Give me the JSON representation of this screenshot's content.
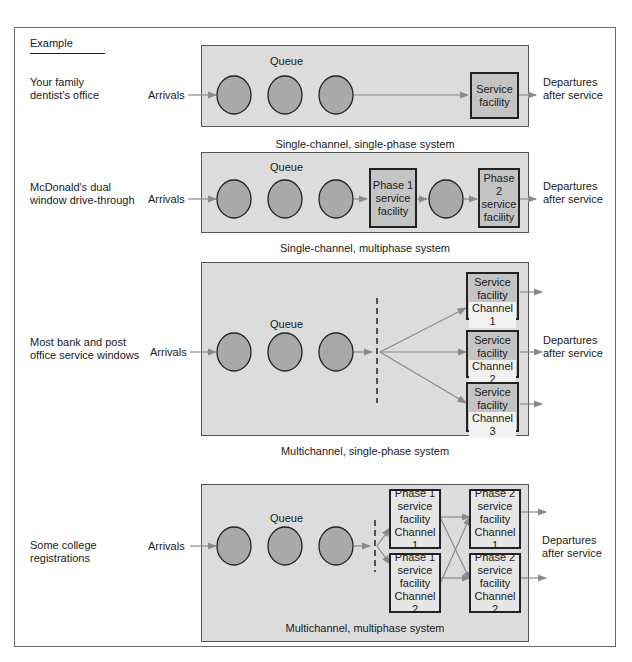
{
  "header": {
    "example_label": "Example"
  },
  "colors": {
    "panel": "#dcdcdc",
    "circle": "#a9a9a9",
    "box": "#c4c4c4",
    "arrow": "#8a8a8a",
    "border": "#222222"
  },
  "rows": [
    {
      "example": "Your family\ndentist's office",
      "arrivals": "Arrivals",
      "queue": "Queue",
      "facility": "Service\nfacility",
      "departures": "Departures\nafter service",
      "caption": "Single-channel, single-phase system"
    },
    {
      "example": "McDonald's dual\nwindow drive-through",
      "arrivals": "Arrivals",
      "queue": "Queue",
      "phase1": "Phase 1\nservice\nfacility",
      "phase2": "Phase 2\nservice\nfacility",
      "departures": "Departures\nafter service",
      "caption": "Single-channel, multiphase system"
    },
    {
      "example": "Most bank and post\noffice service windows",
      "arrivals": "Arrivals",
      "queue": "Queue",
      "channels": [
        {
          "top": "Service\nfacility",
          "label": "Channel 1"
        },
        {
          "top": "Service\nfacility",
          "label": "Channel 2"
        },
        {
          "top": "Service\nfacility",
          "label": "Channel 3"
        }
      ],
      "departures": "Departures\nafter service",
      "caption": "Multichannel, single-phase system"
    },
    {
      "example": "Some college\nregistrations",
      "arrivals": "Arrivals",
      "queue": "Queue",
      "phase1": [
        {
          "top": "Phase 1\nservice\nfacility",
          "label": "Channel 1"
        },
        {
          "top": "Phase 1\nservice\nfacility",
          "label": "Channel 2"
        }
      ],
      "phase2": [
        {
          "top": "Phase 2\nservice\nfacility",
          "label": "Channel 1"
        },
        {
          "top": "Phase 2\nservice\nfacility",
          "label": "Channel 2"
        }
      ],
      "departures": "Departures\nafter service",
      "caption": "Multichannel, multiphase system"
    }
  ]
}
